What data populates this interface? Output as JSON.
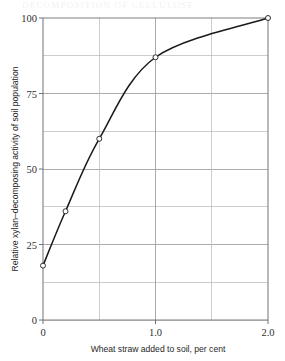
{
  "figure": {
    "page_header_remnant": "DECOMPOSITION OF CELLULOSE",
    "background_color": "#ffffff",
    "curve_color": "#1a1a1a",
    "grid_color": "#b9bcbf",
    "frame_color": "#7d7f82"
  },
  "chart_data": {
    "type": "line",
    "title": "",
    "subtitle": "",
    "xlabel": "Wheat straw added to soil, per cent",
    "ylabel": "Relative xylan–decomposing activity of soil population",
    "xlim": [
      0,
      2.0
    ],
    "ylim": [
      0,
      100
    ],
    "grid": true,
    "x_gridlines": [
      0,
      0.5,
      1.0,
      1.5,
      2.0
    ],
    "y_gridlines": [
      0,
      12.5,
      25,
      37.5,
      50,
      62.5,
      75,
      87.5,
      100
    ],
    "xticks": [
      0,
      1.0,
      2.0
    ],
    "xtick_labels": [
      "0",
      "1.0",
      "2.0"
    ],
    "yticks": [
      0,
      25,
      50,
      75,
      100
    ],
    "ytick_labels": [
      "0",
      "25",
      "50",
      "75",
      "100"
    ],
    "legend": null,
    "legend_position": "none",
    "marker": "open-circle",
    "series": [
      {
        "name": "Relative xylan-decomposing activity",
        "x": [
          0,
          0.2,
          0.5,
          1.0,
          2.0
        ],
        "values": [
          18,
          36,
          60,
          87,
          100
        ]
      }
    ],
    "annotations": []
  }
}
